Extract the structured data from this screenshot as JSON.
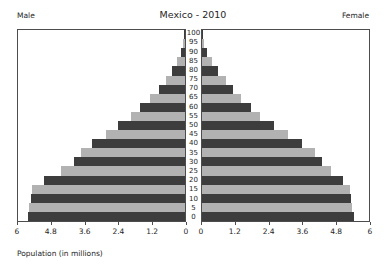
{
  "chart_data": {
    "type": "bar",
    "subtype": "population-pyramid",
    "title": "Mexico - 2010",
    "xlabel": "Population (in millions)",
    "ylabel": "",
    "grid": false,
    "legend": "none",
    "left_panel_label": "Male",
    "right_panel_label": "Female",
    "left_axis_reversed": true,
    "xlim_left": [
      6,
      0
    ],
    "xlim_right": [
      0,
      6
    ],
    "xticks_left": [
      "6",
      "4.8",
      "3.6",
      "2.4",
      "1.2",
      "0"
    ],
    "xticks_right": [
      "0",
      "1.2",
      "2.4",
      "3.6",
      "4.8",
      "6"
    ],
    "xtick_values": [
      0,
      1.2,
      2.4,
      3.6,
      4.8,
      6
    ],
    "categories": [
      "0",
      "5",
      "10",
      "15",
      "20",
      "25",
      "30",
      "35",
      "40",
      "45",
      "50",
      "55",
      "60",
      "65",
      "70",
      "75",
      "80",
      "85",
      "90",
      "95",
      "100"
    ],
    "series": [
      {
        "name": "Male",
        "values": [
          5.65,
          5.6,
          5.55,
          5.5,
          5.05,
          4.45,
          4.0,
          3.75,
          3.35,
          2.85,
          2.4,
          1.95,
          1.6,
          1.25,
          0.95,
          0.7,
          0.45,
          0.28,
          0.14,
          0.06,
          0.02
        ]
      },
      {
        "name": "Female",
        "values": [
          5.45,
          5.4,
          5.35,
          5.3,
          5.05,
          4.65,
          4.3,
          4.05,
          3.6,
          3.1,
          2.6,
          2.1,
          1.75,
          1.4,
          1.1,
          0.85,
          0.58,
          0.36,
          0.19,
          0.08,
          0.03
        ]
      }
    ],
    "bar_colors": {
      "dark": "#3d3d3d",
      "light": "#b2b2b2"
    },
    "axis_color": "#4d4d4d",
    "background": "#ffffff"
  }
}
